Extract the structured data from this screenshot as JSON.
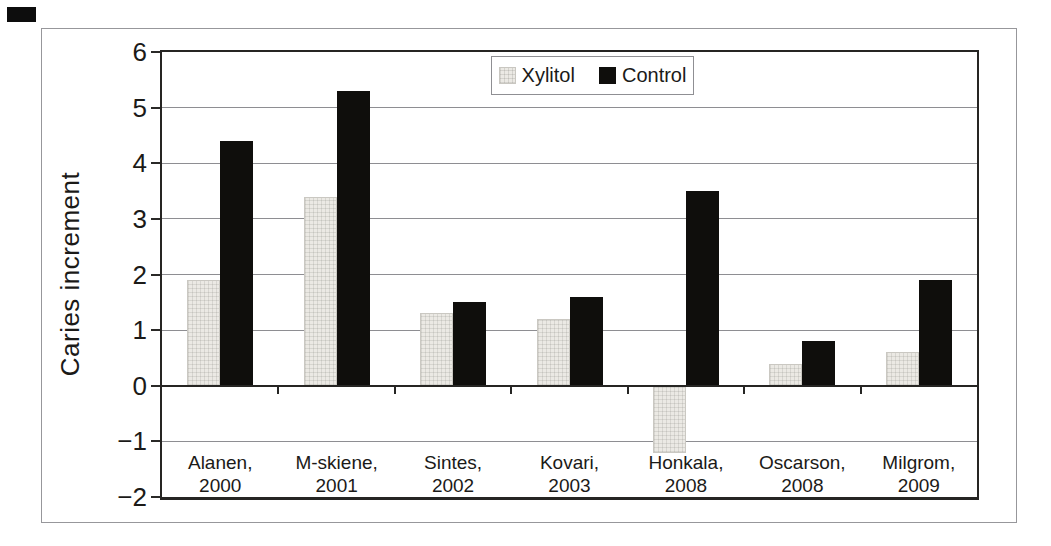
{
  "figure": {
    "background": "#ffffff",
    "frame_border_color": "#97979b",
    "corner_mark_color": "#0d0d0d"
  },
  "chart_data": {
    "type": "bar",
    "title": "",
    "xlabel": "",
    "ylabel": "Caries increment",
    "ylim": [
      -2,
      6
    ],
    "yticks": [
      6,
      5,
      4,
      3,
      2,
      1,
      0,
      -1,
      -2
    ],
    "grid": true,
    "legend": {
      "position": "top-center-inside",
      "entries": [
        "Xylitol",
        "Control"
      ]
    },
    "categories": [
      {
        "line1": "Alanen,",
        "line2": "2000"
      },
      {
        "line1": "M-skiene,",
        "line2": "2001"
      },
      {
        "line1": "Sintes,",
        "line2": "2002"
      },
      {
        "line1": "Kovari,",
        "line2": "2003"
      },
      {
        "line1": "Honkala,",
        "line2": "2008"
      },
      {
        "line1": "Oscarson,",
        "line2": "2008"
      },
      {
        "line1": "Milgrom,",
        "line2": "2009"
      }
    ],
    "series": [
      {
        "name": "Xylitol",
        "color": "#ebe9e4",
        "style": "textured-light-gray",
        "values": [
          1.9,
          3.4,
          1.3,
          1.2,
          -1.2,
          0.4,
          0.6
        ]
      },
      {
        "name": "Control",
        "color": "#0f0e0c",
        "style": "solid-black",
        "values": [
          4.4,
          5.3,
          1.5,
          1.6,
          3.5,
          0.8,
          1.9
        ]
      }
    ],
    "colors": {
      "gridline": "#8e8e92",
      "axis": "#262523",
      "text": "#1b1a18"
    }
  }
}
